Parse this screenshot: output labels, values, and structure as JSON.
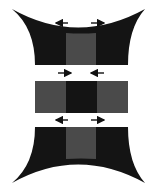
{
  "diagram": {
    "colors": {
      "dark": "#141414",
      "mid": "#4a4a4a",
      "background": "#ffffff",
      "arrow": "#111111"
    },
    "top_bar": {
      "arrows": "outward"
    },
    "middle_bar": {
      "arrows": "inward"
    },
    "bottom_bar": {
      "arrows": "outward"
    }
  }
}
